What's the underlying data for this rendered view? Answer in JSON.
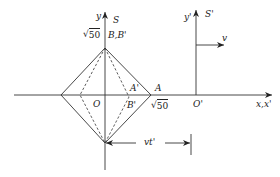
{
  "diagram": {
    "frame_S": {
      "name": "S",
      "y_axis_label": "y",
      "origin_label": "O",
      "x_axis_label": "x,x'"
    },
    "frame_S_prime": {
      "name": "S'",
      "y_axis_label": "y'",
      "origin_label": "O'",
      "velocity_label": "v"
    },
    "points": {
      "top": "B,B'",
      "right": "A",
      "right_inner_upper": "A'",
      "right_inner_lower": "B'"
    },
    "values": {
      "y_intercept": "50",
      "x_intercept": "50"
    },
    "dimension": {
      "label": "vt'"
    },
    "colors": {
      "line": "#222222",
      "background": "#ffffff"
    }
  }
}
